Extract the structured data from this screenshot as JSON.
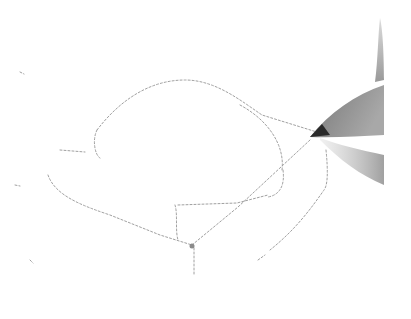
{
  "image": {
    "description": "Pencil sketching a loose outline drawing on white paper",
    "alt": "Hand-drawn pencil sketch with a pencil tip at right",
    "colors": {
      "paper": "#ffffff",
      "sketch_line": "#9a9a9a",
      "pencil_body": "#8c8c8c",
      "pencil_tip": "#2a2a2a",
      "shadow": "#b0b0b0"
    }
  }
}
